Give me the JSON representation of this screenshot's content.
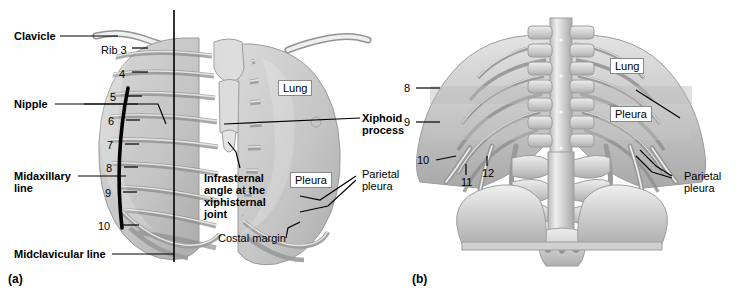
{
  "figure": {
    "background": "#ffffff",
    "ink": "#000000"
  },
  "panels": [
    {
      "id": "a",
      "label": "(a)",
      "view": "anterior",
      "x": 8,
      "y": 272
    },
    {
      "id": "b",
      "label": "(b)",
      "view": "posterior",
      "x": 412,
      "y": 272
    }
  ],
  "panel_a": {
    "labels": [
      {
        "name": "clavicle",
        "text": "Clavicle",
        "bold": true,
        "x": 14,
        "y": 30,
        "boxed": false
      },
      {
        "name": "nipple",
        "text": "Nipple",
        "bold": true,
        "x": 14,
        "y": 98,
        "boxed": false
      },
      {
        "name": "midaxillary-line",
        "text": "Midaxillary\nline",
        "bold": true,
        "x": 14,
        "y": 170,
        "boxed": false
      },
      {
        "name": "midclavicular-line",
        "text": "Midclavicular line",
        "bold": true,
        "x": 14,
        "y": 248,
        "boxed": false
      },
      {
        "name": "lung",
        "text": "Lung",
        "bold": false,
        "x": 278,
        "y": 80,
        "boxed": true
      },
      {
        "name": "pleura",
        "text": "Pleura",
        "bold": false,
        "x": 290,
        "y": 172,
        "boxed": true
      },
      {
        "name": "infrasternal-angle",
        "text": "Infrasternal\nangle at the\nxiphisternal\njoint",
        "bold": true,
        "x": 204,
        "y": 172,
        "boxed": false
      },
      {
        "name": "costal-margin",
        "text": "Costal margin",
        "bold": false,
        "x": 218,
        "y": 232,
        "boxed": false
      },
      {
        "name": "xiphoid-process",
        "text": "Xiphoid\nprocess",
        "bold": true,
        "x": 362,
        "y": 112,
        "boxed": false
      },
      {
        "name": "parietal-pleura",
        "text": "Parietal\npleura",
        "bold": false,
        "x": 362,
        "y": 168,
        "boxed": false
      }
    ],
    "rib_numbers": [
      {
        "label": "Rib 3",
        "x": 101,
        "y": 44
      },
      {
        "label": "4",
        "x": 119,
        "y": 68
      },
      {
        "label": "5",
        "x": 101,
        "y": 92
      },
      {
        "label": "6",
        "x": 101,
        "y": 116
      },
      {
        "label": "7",
        "x": 101,
        "y": 140
      },
      {
        "label": "8",
        "x": 101,
        "y": 163
      },
      {
        "label": "9",
        "x": 101,
        "y": 188
      },
      {
        "label": "10",
        "x": 93,
        "y": 221
      }
    ]
  },
  "panel_b": {
    "labels": [
      {
        "name": "lung",
        "text": "Lung",
        "bold": false,
        "x": 610,
        "y": 58,
        "boxed": true
      },
      {
        "name": "pleura",
        "text": "Pleura",
        "bold": false,
        "x": 610,
        "y": 106,
        "boxed": true
      },
      {
        "name": "parietal-pleura",
        "text": "Parietal\npleura",
        "bold": false,
        "x": 674,
        "y": 170,
        "boxed": false
      }
    ],
    "rib_numbers": [
      {
        "label": "8",
        "x": 404,
        "y": 83
      },
      {
        "label": "9",
        "x": 404,
        "y": 117
      },
      {
        "label": "10",
        "x": 422,
        "y": 155
      },
      {
        "label": "11",
        "x": 461,
        "y": 177
      },
      {
        "label": "12",
        "x": 482,
        "y": 168
      }
    ]
  }
}
